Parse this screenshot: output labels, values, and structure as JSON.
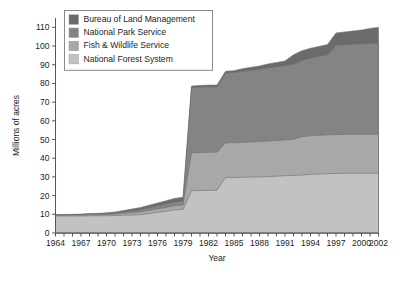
{
  "chart_data": {
    "type": "area",
    "stacked": true,
    "title": "",
    "xlabel": "Year",
    "ylabel": "Millions of acres",
    "xlim": [
      1964,
      2002
    ],
    "ylim": [
      0,
      115
    ],
    "ytick_step": 10,
    "grid": false,
    "legend_position": "top-left",
    "xtick_labels": [
      "1964",
      "1967",
      "1970",
      "1973",
      "1976",
      "1979",
      "1982",
      "1985",
      "1988",
      "1991",
      "1994",
      "1997",
      "2000",
      "2002"
    ],
    "ytick_labels": [
      "0",
      "10",
      "20",
      "30",
      "40",
      "50",
      "60",
      "70",
      "80",
      "90",
      "100",
      "110"
    ],
    "x": [
      1964,
      1965,
      1966,
      1967,
      1968,
      1969,
      1970,
      1971,
      1972,
      1973,
      1974,
      1975,
      1976,
      1977,
      1978,
      1979,
      1980,
      1981,
      1982,
      1983,
      1984,
      1985,
      1986,
      1987,
      1988,
      1989,
      1990,
      1991,
      1992,
      1993,
      1994,
      1995,
      1996,
      1997,
      1998,
      1999,
      2000,
      2001,
      2002
    ],
    "series": [
      {
        "name": "National Forest System",
        "color": "#c2c2c2",
        "values": [
          9.1,
          9.1,
          9.1,
          9.1,
          9.2,
          9.2,
          9.2,
          9.3,
          9.5,
          9.6,
          9.8,
          10.4,
          11.0,
          11.6,
          12.3,
          12.6,
          22.6,
          22.7,
          22.8,
          22.8,
          29.7,
          29.7,
          29.8,
          29.9,
          30.0,
          30.2,
          30.4,
          30.6,
          30.8,
          31.0,
          31.3,
          31.5,
          31.7,
          31.8,
          31.9,
          32.0,
          32.0,
          32.0,
          32.0
        ]
      },
      {
        "name": "Fish & Wildlife Service",
        "color": "#a8a8a8",
        "values": [
          0.4,
          0.4,
          0.5,
          0.5,
          0.6,
          0.6,
          0.7,
          0.8,
          1.0,
          1.3,
          1.5,
          1.7,
          1.9,
          2.1,
          2.3,
          2.4,
          20.3,
          20.4,
          20.4,
          20.4,
          18.5,
          18.6,
          18.7,
          18.8,
          18.9,
          19.0,
          19.1,
          19.2,
          19.3,
          20.5,
          20.7,
          20.8,
          20.8,
          20.8,
          20.8,
          20.8,
          20.8,
          20.8,
          20.8
        ]
      },
      {
        "name": "National Park Service",
        "color": "#848486",
        "values": [
          0.2,
          0.2,
          0.2,
          0.3,
          0.3,
          0.4,
          0.5,
          0.6,
          0.8,
          1.0,
          1.2,
          1.4,
          1.6,
          1.8,
          2.0,
          2.1,
          34.8,
          34.9,
          35.0,
          35.0,
          37.4,
          37.6,
          37.9,
          38.3,
          38.7,
          39.0,
          39.4,
          39.8,
          40.2,
          40.8,
          41.5,
          42.1,
          42.8,
          47.8,
          48.0,
          48.2,
          48.4,
          48.6,
          48.8
        ]
      },
      {
        "name": "Bureau of Land Management",
        "color": "#6b6b6d",
        "values": [
          0.2,
          0.2,
          0.2,
          0.2,
          0.3,
          0.3,
          0.4,
          0.5,
          0.7,
          0.9,
          1.1,
          1.3,
          1.5,
          1.7,
          1.9,
          2.0,
          0.9,
          0.9,
          0.9,
          0.9,
          0.9,
          0.9,
          1.5,
          1.6,
          1.7,
          2.2,
          2.3,
          2.4,
          5.0,
          5.2,
          5.3,
          5.4,
          5.5,
          6.6,
          6.8,
          7.0,
          7.4,
          8.0,
          8.4
        ]
      }
    ],
    "totals": [
      9.9,
      9.9,
      10.0,
      10.1,
      10.4,
      10.5,
      10.8,
      11.2,
      12.0,
      12.8,
      13.6,
      14.8,
      16.0,
      17.2,
      18.5,
      19.1,
      78.6,
      78.9,
      79.1,
      79.1,
      86.5,
      86.8,
      87.9,
      88.6,
      89.3,
      90.4,
      91.2,
      92.0,
      95.3,
      97.5,
      98.8,
      99.8,
      100.8,
      107.0,
      107.5,
      108.0,
      108.6,
      109.4,
      110.0
    ]
  },
  "legend": {
    "items": [
      {
        "label": "Bureau of Land Management",
        "color": "#6b6b6d"
      },
      {
        "label": "National Park Service",
        "color": "#848486"
      },
      {
        "label": "Fish & Wildlife Service",
        "color": "#a8a8a8"
      },
      {
        "label": "National Forest System",
        "color": "#c2c2c2"
      }
    ]
  }
}
